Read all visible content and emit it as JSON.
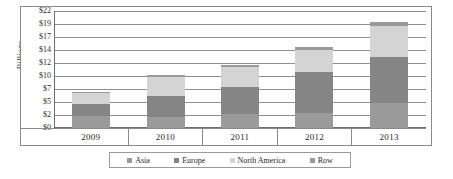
{
  "chart_data": {
    "type": "bar",
    "stacked": true,
    "title": "",
    "xlabel": "",
    "ylabel": "Billions",
    "categories": [
      "2009",
      "2010",
      "2011",
      "2012",
      "2013"
    ],
    "series": [
      {
        "name": "Asia",
        "color": "#9a9a9a",
        "values": [
          2.2,
          2.0,
          2.7,
          2.9,
          4.7
        ]
      },
      {
        "name": "Europe",
        "color": "#858585",
        "values": [
          2.3,
          4.0,
          5.1,
          7.7,
          8.7
        ]
      },
      {
        "name": "North America",
        "color": "#d4d4d4",
        "values": [
          2.1,
          3.6,
          3.7,
          4.1,
          5.7
        ]
      },
      {
        "name": "Row",
        "color": "#9a9a9a",
        "values": [
          0.1,
          0.3,
          0.3,
          0.5,
          0.8
        ]
      }
    ],
    "totals": [
      6.7,
      9.9,
      11.8,
      15.2,
      19.9
    ],
    "ytick_labels": [
      "$22",
      "$19",
      "$17",
      "$14",
      "$12",
      "$10",
      "$7",
      "$5",
      "$2",
      "$0"
    ],
    "ytick_values": [
      22,
      19,
      17,
      14,
      12,
      10,
      7,
      5,
      2,
      0
    ],
    "ylim": [
      0,
      22
    ],
    "grid": true,
    "legend_position": "bottom"
  },
  "axis": {
    "y_title": "Billions"
  }
}
